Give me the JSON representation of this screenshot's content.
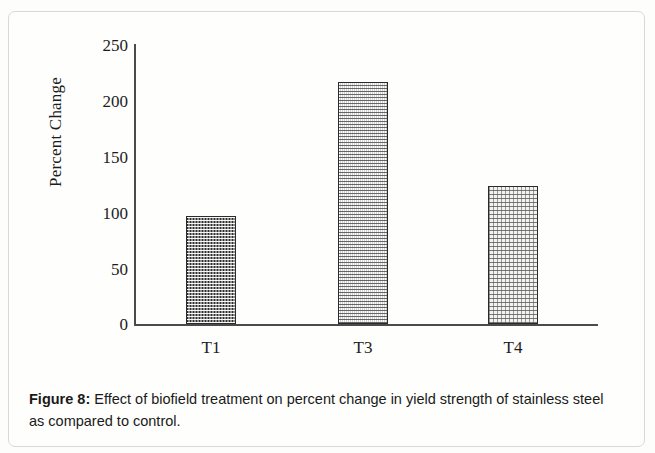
{
  "figure": {
    "caption_label": "Figure 8",
    "caption_separator": ":",
    "caption_text": " Effect of biofield treatment on percent change in yield strength of stainless steel as compared to control."
  },
  "chart_data": {
    "type": "bar",
    "title": "",
    "subtitle": "",
    "xlabel": "",
    "ylabel": "Percent Change",
    "categories": [
      "T1",
      "T3",
      "T4"
    ],
    "values": [
      96,
      216,
      123
    ],
    "series": [
      {
        "name": "Percent Change",
        "values": [
          96,
          216,
          123
        ]
      }
    ],
    "ylim": [
      0,
      250
    ],
    "ytick_labels": [
      "250",
      "200",
      "150",
      "100",
      "50",
      "0"
    ],
    "ytick_values": [
      250,
      200,
      150,
      100,
      50,
      0
    ],
    "grid": false,
    "legend": "none",
    "bar_styles": [
      "dark-checker",
      "medium-dotted",
      "light-dotted"
    ],
    "bar_border_color": "#2a2a2a",
    "axis_color": "#4b4b4b"
  }
}
